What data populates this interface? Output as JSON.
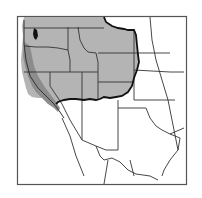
{
  "map": {
    "subject": "Western United States range map",
    "colors": {
      "background": "#ffffff",
      "frame": "#555555",
      "range_fill": "#b4b4b4",
      "coastal_fill": "#8c8c8c",
      "state_lines": "#333333",
      "range_outline": "#111111",
      "water_black": "#111111"
    },
    "regions": [
      {
        "name": "shaded-range",
        "description": "Shaded western range"
      },
      {
        "name": "coastal-strip",
        "description": "Darker Pacific coastal strip"
      }
    ]
  }
}
